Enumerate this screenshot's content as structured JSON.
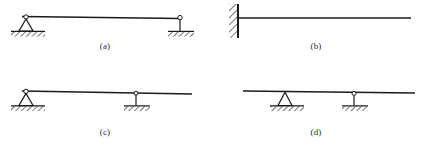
{
  "figure": {
    "background_color": "#ffffff",
    "line_color": "#1a1a1a",
    "hatch_color": "#3a3a3a",
    "panel_count": 4
  },
  "panels": [
    {
      "key": "a",
      "caption": "(a)",
      "beam_type": "simply-supported-beam",
      "description": "Horizontal beam supported at both ends",
      "beam": {
        "x1": 22,
        "y1": 17,
        "x2": 180,
        "y2": 19
      },
      "supports": [
        {
          "name": "pin-support",
          "icon": "pin-support-icon",
          "position": "left-end",
          "x": 26,
          "y": 19,
          "ground_y": 32,
          "ground_x1": 10,
          "ground_x2": 50
        },
        {
          "name": "link-support",
          "icon": "link-support-icon",
          "position": "right-end",
          "x": 180,
          "y": 19,
          "ground_y": 32,
          "ground_x1": 166,
          "ground_x2": 196
        }
      ]
    },
    {
      "key": "b",
      "caption": "(b)",
      "beam_type": "cantilever-beam",
      "description": "Beam built into a wall at the left end, free at the right",
      "beam": {
        "x1": 27,
        "y1": 18,
        "x2": 200,
        "y2": 18
      },
      "supports": [
        {
          "name": "fixed-support",
          "icon": "fixed-wall-support-icon",
          "position": "left-end",
          "x": 27,
          "wall_y1": 4,
          "wall_y2": 38
        }
      ]
    },
    {
      "key": "c",
      "caption": "(c)",
      "beam_type": "beam-with-one-overhang",
      "description": "Pin support at left end, interior link support, right overhang",
      "beam": {
        "x1": 22,
        "y1": 16,
        "x2": 192,
        "y2": 19
      },
      "supports": [
        {
          "name": "pin-support",
          "icon": "pin-support-icon",
          "position": "left-end",
          "x": 26,
          "y": 18,
          "ground_y": 31,
          "ground_x1": 10,
          "ground_x2": 50
        },
        {
          "name": "link-support",
          "icon": "link-support-icon",
          "position": "interior",
          "x": 136,
          "y": 18,
          "ground_y": 31,
          "ground_x1": 122,
          "ground_x2": 152
        }
      ]
    },
    {
      "key": "d",
      "caption": "(d)",
      "beam_type": "beam-with-two-overhangs",
      "description": "Two interior supports with overhangs at both ends",
      "beam": {
        "x1": 32,
        "y1": 16,
        "x2": 204,
        "y2": 18
      },
      "supports": [
        {
          "name": "pin-support",
          "icon": "pin-support-icon",
          "position": "interior-left",
          "x": 74,
          "y": 17,
          "ground_y": 31,
          "ground_x1": 58,
          "ground_x2": 98
        },
        {
          "name": "link-support",
          "icon": "link-support-icon",
          "position": "interior-right",
          "x": 143,
          "y": 17,
          "ground_y": 31,
          "ground_x1": 129,
          "ground_x2": 159
        }
      ]
    }
  ]
}
